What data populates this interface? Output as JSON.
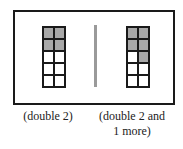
{
  "figure": {
    "left_frame": {
      "caption": "(double 2)",
      "rows": 5,
      "cols": 2,
      "shaded": [
        true,
        true,
        true,
        true,
        false,
        false,
        false,
        false,
        false,
        false
      ]
    },
    "right_frame": {
      "caption_line1": "(double 2 and",
      "caption_line2": "1 more)",
      "rows": 5,
      "cols": 2,
      "shaded": [
        true,
        true,
        true,
        true,
        false,
        true,
        false,
        false,
        false,
        false
      ]
    },
    "colors": {
      "border": "#1a1a1a",
      "shaded": "#a8a8a8",
      "divider": "#9a9a9a"
    }
  }
}
